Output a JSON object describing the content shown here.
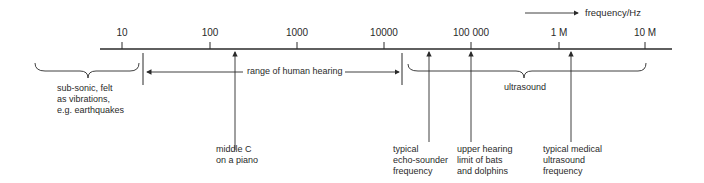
{
  "axis": {
    "label": "frequency/Hz",
    "ticks": [
      {
        "label": "10",
        "x": 122
      },
      {
        "label": "100",
        "x": 210
      },
      {
        "label": "1000",
        "x": 297
      },
      {
        "label": "10000",
        "x": 384
      },
      {
        "label": "100 000",
        "x": 471
      },
      {
        "label": "1 M",
        "x": 559
      },
      {
        "label": "10 M",
        "x": 645
      }
    ]
  },
  "ranges": {
    "subsonic": "sub-sonic, felt\nas vibrations,\ne.g. earthquakes",
    "human_hearing": "range of human hearing",
    "ultrasound": "ultrasound"
  },
  "markers": {
    "middle_c": "middle C\non a piano",
    "echo_sounder": "typical\necho-sounder\nfrequency",
    "bats": "upper hearing\nlimit of bats\nand dolphins",
    "medical": "typical medical\nultrasound\nfrequency"
  },
  "colors": {
    "ink": "#2a2a2a"
  }
}
